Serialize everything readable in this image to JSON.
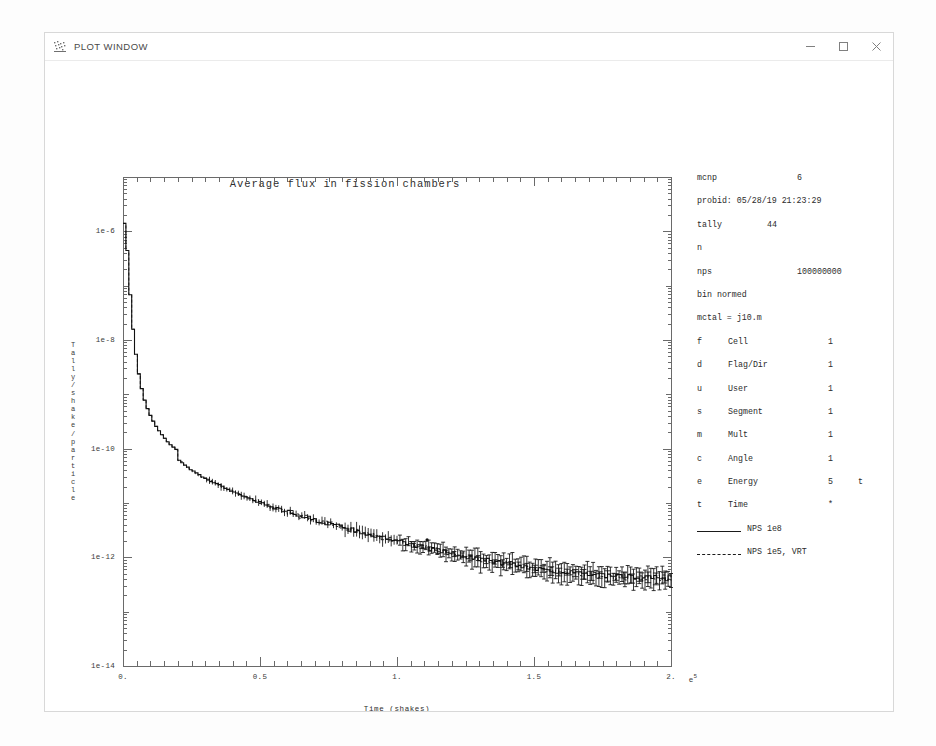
{
  "window": {
    "title": "PLOT WINDOW",
    "icon": "scatter-plot-icon",
    "minimize": "–",
    "maximize": "□",
    "close": "✕"
  },
  "chart_data": {
    "type": "line",
    "title": "Average flux in fission chambers",
    "xlabel": "Time (shakes)",
    "ylabel": "Tally/shake/particle",
    "x_exponent": "e5",
    "xlim": [
      0.0,
      2.0
    ],
    "ylim": [
      1e-14,
      1e-05
    ],
    "yscale": "log",
    "xscale": "linear",
    "grid": false,
    "xticks": [
      0.0,
      0.5,
      1.0,
      1.5,
      2.0
    ],
    "xticklabels": [
      "0.",
      "0.5",
      "1.",
      "1.5",
      "2."
    ],
    "yticks": [
      1e-06,
      1e-08,
      1e-10,
      1e-12,
      1e-14
    ],
    "yticklabels": [
      "1e-6",
      "1e-8",
      "1e-10",
      "1e-12",
      "1e-14"
    ],
    "legend_position": "right-panel",
    "series": [
      {
        "name": "NPS 1e8",
        "style": "solid",
        "x": [
          0.0,
          0.004,
          0.008,
          0.012,
          0.016,
          0.02,
          0.026,
          0.032,
          0.04,
          0.05,
          0.06,
          0.07,
          0.08,
          0.09,
          0.1,
          0.115,
          0.13,
          0.145,
          0.16,
          0.175,
          0.19,
          0.2,
          0.21,
          0.23,
          0.25,
          0.28,
          0.31,
          0.35,
          0.4,
          0.45,
          0.5,
          0.55,
          0.6,
          0.65,
          0.7,
          0.75,
          0.8,
          0.85,
          0.9,
          0.95,
          1.0,
          1.05,
          1.1,
          1.15,
          1.2,
          1.25,
          1.3,
          1.35,
          1.4,
          1.45,
          1.5,
          1.55,
          1.6,
          1.65,
          1.7,
          1.75,
          1.8,
          1.85,
          1.9,
          1.95,
          2.0
        ],
        "y": [
          1.4e-06,
          1.2e-06,
          7e-07,
          3.4e-07,
          1.6e-07,
          8e-08,
          3.2e-08,
          1.5e-08,
          6.5e-09,
          2.8e-09,
          1.5e-09,
          9e-10,
          6.2e-10,
          4.6e-10,
          3.6e-10,
          2.6e-10,
          2e-10,
          1.6e-10,
          1.3e-10,
          1.1e-10,
          9.8e-11,
          6.2e-11,
          5.6e-11,
          4.6e-11,
          3.9e-11,
          3.1e-11,
          2.6e-11,
          2.1e-11,
          1.6e-11,
          1.25e-11,
          1e-11,
          8.2e-12,
          6.8e-12,
          5.7e-12,
          4.8e-12,
          4.1e-12,
          3.5e-12,
          3e-12,
          2.6e-12,
          2.25e-12,
          1.95e-12,
          1.7e-12,
          1.5e-12,
          1.32e-12,
          1.17e-12,
          1.04e-12,
          9.3e-13,
          8.4e-13,
          7.6e-13,
          6.9e-13,
          6.3e-13,
          5.8e-13,
          5.4e-13,
          5.1e-13,
          4.8e-13,
          4.6e-13,
          4.4e-13,
          4.3e-13,
          4.2e-13,
          4.15e-13,
          4.1e-13
        ]
      },
      {
        "name": "NPS 1e5, VRT",
        "style": "dashed",
        "note": "overlays the solid curve; shown with vertical error bars"
      }
    ],
    "annotations": [
      {
        "type": "point",
        "x": 1.11,
        "y": 2.1e-12,
        "marker": "dot"
      }
    ]
  },
  "info_panel": {
    "rows": [
      {
        "label": "mcnp",
        "value": "6",
        "value_x": 100
      },
      {
        "label": "probid: 05/28/19 21:23:29",
        "value": "",
        "value_x": 0
      },
      {
        "label": "tally",
        "value": "44",
        "value_x": 70
      },
      {
        "label": "n",
        "value": "",
        "value_x": 0
      },
      {
        "label": "nps",
        "value": "100000000",
        "value_x": 100
      },
      {
        "label": "bin normed",
        "value": "",
        "value_x": 0
      },
      {
        "label": "mctal = j10.m",
        "value": "",
        "value_x": 0
      }
    ],
    "bins": [
      {
        "key": "f",
        "name": "Cell",
        "value": "1",
        "extra": ""
      },
      {
        "key": "d",
        "name": "Flag/Dir",
        "value": "1",
        "extra": ""
      },
      {
        "key": "u",
        "name": "User",
        "value": "1",
        "extra": ""
      },
      {
        "key": "s",
        "name": "Segment",
        "value": "1",
        "extra": ""
      },
      {
        "key": "m",
        "name": "Mult",
        "value": "1",
        "extra": ""
      },
      {
        "key": "c",
        "name": "Angle",
        "value": "1",
        "extra": ""
      },
      {
        "key": "e",
        "name": "Energy",
        "value": "5",
        "extra": "t"
      },
      {
        "key": "t",
        "name": "Time",
        "value": "*",
        "extra": ""
      }
    ],
    "legend": [
      {
        "label": "NPS 1e8",
        "style": "solid"
      },
      {
        "label": "NPS 1e5, VRT",
        "style": "dashed"
      }
    ]
  },
  "colors": {
    "axis": "#6a6a6a",
    "curve": "#111111",
    "text": "#2b2b2b",
    "window_border": "#d8d8d8",
    "page": "#fdfdfd"
  }
}
